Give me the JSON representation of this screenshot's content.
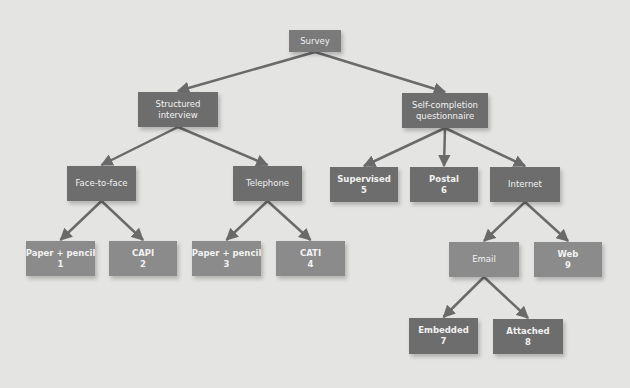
{
  "diagram": {
    "title": "Survey",
    "colors": {
      "background": "#e4e4e2",
      "node_dark": "#6d6d6d",
      "node_mid": "#7a7a7a",
      "node_light": "#8b8b8b",
      "edge": "#6a6a6a",
      "text": "#f2f2f2"
    },
    "nodes": [
      {
        "id": "survey",
        "lines": [
          "Survey"
        ],
        "x": 289,
        "y": 30,
        "w": 52,
        "h": 22,
        "tone": "mid",
        "bold": false
      },
      {
        "id": "structured",
        "lines": [
          "Structured",
          "interview"
        ],
        "x": 138,
        "y": 92,
        "w": 80,
        "h": 35,
        "tone": "dark",
        "bold": false
      },
      {
        "id": "selfcompletion",
        "lines": [
          "Self-completion",
          "questionnaire"
        ],
        "x": 402,
        "y": 93,
        "w": 86,
        "h": 35,
        "tone": "dark",
        "bold": false
      },
      {
        "id": "facetoface",
        "lines": [
          "Face-to-face"
        ],
        "x": 67,
        "y": 166,
        "w": 69,
        "h": 35,
        "tone": "dark",
        "bold": false
      },
      {
        "id": "telephone",
        "lines": [
          "Telephone"
        ],
        "x": 233,
        "y": 166,
        "w": 69,
        "h": 35,
        "tone": "dark",
        "bold": false
      },
      {
        "id": "supervised",
        "lines": [
          "Supervised",
          "5"
        ],
        "x": 330,
        "y": 167,
        "w": 68,
        "h": 35,
        "tone": "dark",
        "bold": true
      },
      {
        "id": "postal",
        "lines": [
          "Postal",
          "6"
        ],
        "x": 410,
        "y": 167,
        "w": 68,
        "h": 35,
        "tone": "dark",
        "bold": true
      },
      {
        "id": "internet",
        "lines": [
          "Internet"
        ],
        "x": 490,
        "y": 167,
        "w": 70,
        "h": 35,
        "tone": "dark",
        "bold": false
      },
      {
        "id": "paperpencil1",
        "lines": [
          "Paper + pencil",
          "1"
        ],
        "x": 26,
        "y": 241,
        "w": 69,
        "h": 35,
        "tone": "light",
        "bold": true
      },
      {
        "id": "capi",
        "lines": [
          "CAPI",
          "2"
        ],
        "x": 109,
        "y": 241,
        "w": 68,
        "h": 35,
        "tone": "light",
        "bold": true
      },
      {
        "id": "paperpencil3",
        "lines": [
          "Paper + pencil",
          "3"
        ],
        "x": 192,
        "y": 241,
        "w": 69,
        "h": 35,
        "tone": "light",
        "bold": true
      },
      {
        "id": "cati",
        "lines": [
          "CATI",
          "4"
        ],
        "x": 276,
        "y": 241,
        "w": 69,
        "h": 35,
        "tone": "light",
        "bold": true
      },
      {
        "id": "email",
        "lines": [
          "Email"
        ],
        "x": 449,
        "y": 242,
        "w": 70,
        "h": 35,
        "tone": "light",
        "bold": false
      },
      {
        "id": "web",
        "lines": [
          "Web",
          "9"
        ],
        "x": 534,
        "y": 242,
        "w": 68,
        "h": 35,
        "tone": "light",
        "bold": true
      },
      {
        "id": "embedded",
        "lines": [
          "Embedded",
          "7"
        ],
        "x": 409,
        "y": 318,
        "w": 69,
        "h": 36,
        "tone": "dark",
        "bold": true
      },
      {
        "id": "attached",
        "lines": [
          "Attached",
          "8"
        ],
        "x": 493,
        "y": 319,
        "w": 70,
        "h": 35,
        "tone": "dark",
        "bold": true
      }
    ],
    "edges": [
      {
        "from": "survey",
        "to": "structured"
      },
      {
        "from": "survey",
        "to": "selfcompletion"
      },
      {
        "from": "structured",
        "to": "facetoface"
      },
      {
        "from": "structured",
        "to": "telephone"
      },
      {
        "from": "selfcompletion",
        "to": "supervised"
      },
      {
        "from": "selfcompletion",
        "to": "postal"
      },
      {
        "from": "selfcompletion",
        "to": "internet"
      },
      {
        "from": "facetoface",
        "to": "paperpencil1"
      },
      {
        "from": "facetoface",
        "to": "capi"
      },
      {
        "from": "telephone",
        "to": "paperpencil3"
      },
      {
        "from": "telephone",
        "to": "cati"
      },
      {
        "from": "internet",
        "to": "email"
      },
      {
        "from": "internet",
        "to": "web"
      },
      {
        "from": "email",
        "to": "embedded"
      },
      {
        "from": "email",
        "to": "attached"
      }
    ]
  }
}
